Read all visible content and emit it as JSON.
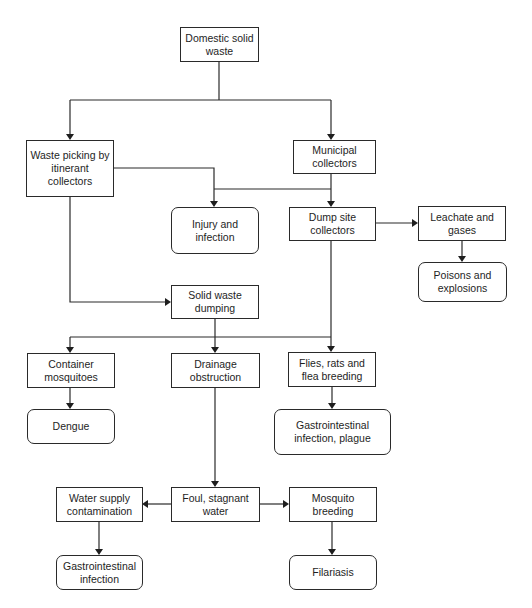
{
  "diagram": {
    "type": "flowchart",
    "title": "",
    "nodes": {
      "domestic_solid_waste": {
        "label": "Domestic solid\nwaste",
        "shape": "rectangle"
      },
      "waste_picking": {
        "label": "Waste picking by\nitinerant\ncollectors",
        "shape": "rectangle"
      },
      "municipal_collectors": {
        "label": "Municipal\ncollectors",
        "shape": "rectangle"
      },
      "injury_infection": {
        "label": "Injury and\ninfection",
        "shape": "rounded"
      },
      "dump_site_collectors": {
        "label": "Dump site\ncollectors",
        "shape": "rectangle"
      },
      "leachate_gases": {
        "label": "Leachate and\ngases",
        "shape": "rectangle"
      },
      "poisons_explosions": {
        "label": "Poisons and\nexplosions",
        "shape": "rounded"
      },
      "solid_waste_dumping": {
        "label": "Solid waste\ndumping",
        "shape": "rectangle"
      },
      "container_mosquitoes": {
        "label": "Container\nmosquitoes",
        "shape": "rectangle"
      },
      "drainage_obstruction": {
        "label": "Drainage\nobstruction",
        "shape": "rectangle"
      },
      "flies_rats_flea": {
        "label": "Flies, rats and\nflea breeding",
        "shape": "rectangle"
      },
      "dengue": {
        "label": "Dengue",
        "shape": "rounded"
      },
      "gastro_plague": {
        "label": "Gastrointestinal\ninfection, plague",
        "shape": "rounded"
      },
      "foul_water": {
        "label": "Foul, stagnant\nwater",
        "shape": "rectangle"
      },
      "water_supply_contamination": {
        "label": "Water supply\ncontamination",
        "shape": "rectangle"
      },
      "mosquito_breeding": {
        "label": "Mosquito\nbreeding",
        "shape": "rectangle"
      },
      "gastro_infection": {
        "label": "Gastrointestinal\ninfection",
        "shape": "rounded"
      },
      "filariasis": {
        "label": "Filariasis",
        "shape": "rounded"
      }
    },
    "edges": [
      {
        "from": "domestic_solid_waste",
        "to": "waste_picking"
      },
      {
        "from": "domestic_solid_waste",
        "to": "municipal_collectors"
      },
      {
        "from": "waste_picking",
        "to": "injury_infection"
      },
      {
        "from": "municipal_collectors",
        "to": "injury_infection"
      },
      {
        "from": "municipal_collectors",
        "to": "dump_site_collectors"
      },
      {
        "from": "dump_site_collectors",
        "to": "leachate_gases"
      },
      {
        "from": "leachate_gases",
        "to": "poisons_explosions"
      },
      {
        "from": "waste_picking",
        "to": "solid_waste_dumping"
      },
      {
        "from": "solid_waste_dumping",
        "to": "container_mosquitoes"
      },
      {
        "from": "solid_waste_dumping",
        "to": "drainage_obstruction"
      },
      {
        "from": "dump_site_collectors",
        "to": "flies_rats_flea"
      },
      {
        "from": "container_mosquitoes",
        "to": "dengue"
      },
      {
        "from": "flies_rats_flea",
        "to": "gastro_plague"
      },
      {
        "from": "drainage_obstruction",
        "to": "foul_water"
      },
      {
        "from": "foul_water",
        "to": "water_supply_contamination"
      },
      {
        "from": "foul_water",
        "to": "mosquito_breeding"
      },
      {
        "from": "water_supply_contamination",
        "to": "gastro_infection"
      },
      {
        "from": "mosquito_breeding",
        "to": "filariasis"
      }
    ],
    "colors": {
      "stroke": "#2a2a2a",
      "text": "#1e1e1e",
      "background": "#ffffff"
    }
  }
}
